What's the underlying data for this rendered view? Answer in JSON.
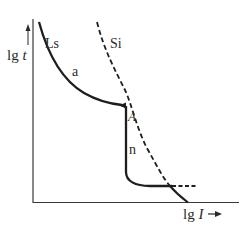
{
  "diagram": {
    "type": "time-current characteristic",
    "axes": {
      "y_label_prefix": "lg ",
      "y_label_var": "t",
      "x_label_prefix": "lg ",
      "x_label_var": "I",
      "x_arrow": "→",
      "y_arrow": "↑"
    },
    "curves": [
      {
        "id": "Ls",
        "label": "Ls",
        "style": "solid"
      },
      {
        "id": "Si",
        "label": "Si",
        "style": "dashed"
      }
    ],
    "region_labels": {
      "a": "a",
      "n": "n",
      "A": "A"
    },
    "colors": {
      "line": "#1e1e1e",
      "text": "#2a2a2a",
      "background": "#ffffff"
    }
  }
}
